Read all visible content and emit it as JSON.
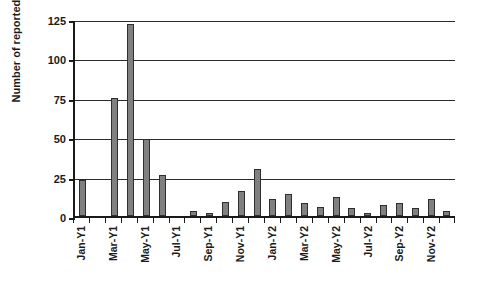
{
  "chart_data": {
    "type": "bar",
    "title": "",
    "xlabel": "",
    "ylabel": "Number of reported failures",
    "ylim": [
      0,
      125
    ],
    "yticks": [
      0,
      25,
      50,
      75,
      100,
      125
    ],
    "grid": true,
    "legend": "none",
    "bar_color": "#808080",
    "bar_edge_color": "#2e2e2e",
    "axis_color": "#1a1a1a",
    "categories": [
      "Jan-Y1",
      "Feb-Y1",
      "Mar-Y1",
      "Apr-Y1",
      "May-Y1",
      "Jun-Y1",
      "Jul-Y1",
      "Aug-Y1",
      "Sep-Y1",
      "Oct-Y1",
      "Nov-Y1",
      "Dec-Y1",
      "Jan-Y2",
      "Feb-Y2",
      "Mar-Y2",
      "Apr-Y2",
      "May-Y2",
      "Jun-Y2",
      "Jul-Y2",
      "Aug-Y2",
      "Sep-Y2",
      "Oct-Y2",
      "Nov-Y2",
      "Dec-Y2"
    ],
    "tick_labels": [
      "Jan-Y1",
      "",
      "Mar-Y1",
      "",
      "May-Y1",
      "",
      "Jul-Y1",
      "",
      "Sep-Y1",
      "",
      "Nov-Y1",
      "",
      "Jan-Y2",
      "",
      "Mar-Y2",
      "",
      "May-Y2",
      "",
      "Jul-Y2",
      "",
      "Sep-Y2",
      "",
      "Nov-Y2",
      ""
    ],
    "values": [
      23,
      0,
      75,
      122,
      49,
      26,
      0,
      3,
      2,
      9,
      16,
      30,
      11,
      14,
      8,
      6,
      12,
      5,
      2,
      7,
      8,
      5,
      11,
      3
    ]
  }
}
